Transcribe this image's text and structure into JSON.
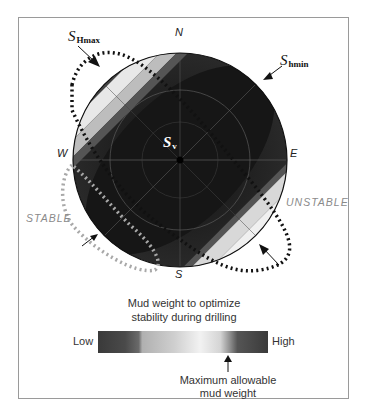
{
  "diagram": {
    "compass": {
      "north": "N",
      "south": "S",
      "east": "E",
      "west": "W"
    },
    "stresses": {
      "shmax": {
        "symbol": "S",
        "subscript": "Hmax"
      },
      "shmin": {
        "symbol": "S",
        "subscript": "hmin"
      },
      "sv": {
        "symbol": "S",
        "subscript": "v"
      }
    },
    "zones": {
      "stable": "STABLE",
      "unstable": "UNSTABLE"
    },
    "colors": {
      "dark": "#1e1e1e",
      "light": "#f2f2f2",
      "stable_outline": "#a8a8a8",
      "unstable_outline": "#111111"
    }
  },
  "legend": {
    "title_line1": "Mud weight to optimize",
    "title_line2": "stability during drilling",
    "low": "Low",
    "high": "High",
    "marker_line1": "Maximum allowable",
    "marker_line2": "mud weight",
    "gradient_stops": [
      "#3a3a3a",
      "#444",
      "#4a4a4a",
      "#6a6a6a",
      "#b0b0b0",
      "#c8c8c8",
      "#d8d8d8",
      "#eeeeee",
      "#f2f2f2",
      "#d0d0d0",
      "#8a8a8a",
      "#555",
      "#444",
      "#3a3a3a"
    ]
  }
}
